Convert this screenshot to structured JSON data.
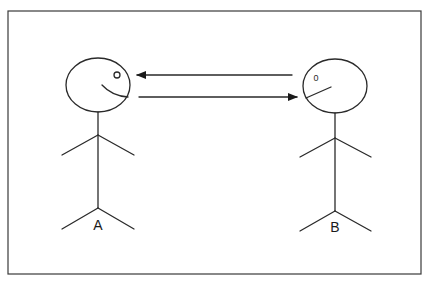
{
  "diagram": {
    "type": "communication",
    "colors": {
      "stroke": "#2a2a2a",
      "background": "#ffffff",
      "frame": "#3a3a3a"
    },
    "persons": [
      {
        "id": "A",
        "label": "A",
        "eye_glyph": "o"
      },
      {
        "id": "B",
        "label": "B",
        "eye_glyph": "0"
      }
    ],
    "arrows": [
      {
        "from": "B",
        "to": "A",
        "direction": "left"
      },
      {
        "from": "A",
        "to": "B",
        "direction": "right"
      }
    ]
  }
}
